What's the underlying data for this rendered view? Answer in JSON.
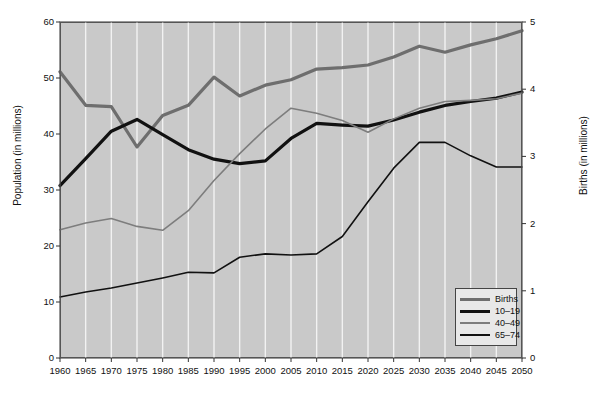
{
  "chart_data": {
    "type": "line",
    "title": "",
    "xlabel": "",
    "ylabel": "Population (in millions)",
    "y2label": "Births (in millions)",
    "grid": "vertical-white",
    "legend_position": "bottom-right",
    "x": [
      1960,
      1965,
      1970,
      1975,
      1980,
      1985,
      1990,
      1995,
      2000,
      2005,
      2010,
      2015,
      2020,
      2025,
      2030,
      2035,
      2040,
      2045,
      2050
    ],
    "xtick_labels": [
      "1960",
      "1965",
      "1970",
      "1975",
      "1980",
      "1985",
      "1990",
      "1995",
      "2000",
      "2005",
      "2010",
      "2015",
      "2020",
      "2025",
      "2030",
      "2035",
      "2040",
      "2045",
      "2050"
    ],
    "xlim": [
      1960,
      2050
    ],
    "ylim": [
      0,
      60
    ],
    "ytick_labels": [
      "0",
      "10",
      "20",
      "30",
      "40",
      "50",
      "60"
    ],
    "ytick_values": [
      0,
      10,
      20,
      30,
      40,
      50,
      60
    ],
    "y2lim": [
      0,
      5
    ],
    "y2tick_labels": [
      "0",
      "1",
      "2",
      "3",
      "4",
      "5"
    ],
    "y2tick_values": [
      0,
      1,
      2,
      3,
      4,
      5
    ],
    "series": [
      {
        "name": "Births",
        "axis": "right",
        "color": "#6e6e6e",
        "width": 3.2,
        "values": [
          4.26,
          3.76,
          3.74,
          3.14,
          3.61,
          3.76,
          4.18,
          3.9,
          4.06,
          4.14,
          4.3,
          4.32,
          4.36,
          4.48,
          4.64,
          4.55,
          4.66,
          4.75,
          4.87
        ]
      },
      {
        "name": "10–19",
        "axis": "left",
        "color": "#111111",
        "width": 3.2,
        "values": [
          30.8,
          35.6,
          40.5,
          42.6,
          39.9,
          37.2,
          35.5,
          34.7,
          35.2,
          39.2,
          41.9,
          41.6,
          41.4,
          42.5,
          43.9,
          45.1,
          45.8,
          46.4,
          47.5
        ]
      },
      {
        "name": "40–49",
        "axis": "left",
        "color": "#7d7d7d",
        "width": 1.6,
        "values": [
          22.9,
          24.1,
          24.9,
          23.5,
          22.8,
          26.3,
          31.7,
          36.5,
          40.9,
          44.6,
          43.7,
          42.4,
          40.3,
          42.7,
          44.6,
          45.8,
          46.0,
          46.3,
          47.3
        ]
      },
      {
        "name": "65–74",
        "axis": "left",
        "color": "#111111",
        "width": 1.6,
        "values": [
          10.9,
          11.8,
          12.5,
          13.4,
          14.3,
          15.3,
          15.2,
          18.0,
          18.6,
          18.4,
          18.6,
          21.7,
          27.9,
          33.9,
          38.5,
          38.5,
          36.1,
          34.1,
          34.1
        ]
      }
    ]
  },
  "legend": {
    "entries": [
      {
        "label": "Births"
      },
      {
        "label": "10–19"
      },
      {
        "label": "40–49"
      },
      {
        "label": "65–74"
      }
    ]
  },
  "axes": {
    "left_title": "Population (in millions)",
    "right_title": "Births (in millions)"
  }
}
